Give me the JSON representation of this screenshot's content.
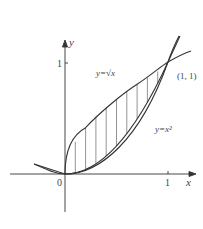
{
  "diagram": {
    "type": "area-between-curves",
    "axes": {
      "x_label": "x",
      "y_label": "y",
      "origin_label": "0",
      "x_tick_label": "1",
      "y_tick_label": "1"
    },
    "curves": [
      {
        "name": "sqrt",
        "label": "y=√x",
        "equation": "y = sqrt(x)"
      },
      {
        "name": "square",
        "label": "y=x²",
        "equation": "y = x^2"
      }
    ],
    "intersection_label": "(1, 1)",
    "shaded_region": "between y=sqrt(x) and y=x^2 for 0 ≤ x ≤ 1, vertical hatching",
    "colors": {
      "ink": "#333333",
      "hatch": "#555555",
      "background": "#ffffff"
    }
  }
}
